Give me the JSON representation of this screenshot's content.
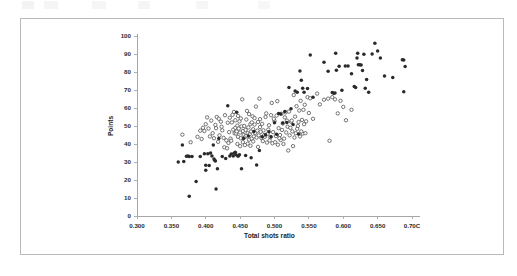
{
  "figure": {
    "background_color": "#ffffff",
    "border_color": "#b9b9b9",
    "frame": {
      "x": 20,
      "y": 18,
      "width": 484,
      "height": 237
    }
  },
  "chart_data": {
    "type": "scatter",
    "title": "",
    "xlabel": "Total shots ratio",
    "ylabel": "Points",
    "xlim": [
      0.3,
      0.7
    ],
    "ylim": [
      0,
      100
    ],
    "grid": false,
    "legend": null,
    "xticks": [
      0.3,
      0.35,
      0.4,
      0.45,
      0.5,
      0.55,
      0.6,
      0.65,
      0.7
    ],
    "xtick_labels": [
      "0.300",
      "0.350",
      "0.400",
      "0.450",
      "0.500",
      "0.550",
      "0.600",
      "0.650",
      "0.70C"
    ],
    "yticks": [
      0,
      10,
      20,
      30,
      40,
      50,
      60,
      70,
      80,
      90,
      100
    ],
    "ytick_labels": [
      "0",
      "10",
      "20",
      "30",
      "40",
      "50",
      "60",
      "70",
      "80",
      "90",
      "100"
    ],
    "plot_area_px": {
      "x0": 137,
      "y0": 216,
      "x1": 412,
      "y1": 36
    },
    "marker_colors": {
      "filled": "#2a2a2a",
      "open_edge": "#4a4a4a",
      "open_face": "#ffffff"
    },
    "series": [
      {
        "name": "filled",
        "marker": "filled-circle",
        "points": [
          [
            0.36,
            30.0
          ],
          [
            0.366,
            39.4
          ],
          [
            0.368,
            30.3
          ],
          [
            0.372,
            33.2
          ],
          [
            0.374,
            33.3
          ],
          [
            0.376,
            33.0
          ],
          [
            0.376,
            11.0
          ],
          [
            0.38,
            33.0
          ],
          [
            0.386,
            19.2
          ],
          [
            0.392,
            33.0
          ],
          [
            0.398,
            34.6
          ],
          [
            0.4,
            28.2
          ],
          [
            0.4,
            25.4
          ],
          [
            0.403,
            34.6
          ],
          [
            0.405,
            28.1
          ],
          [
            0.407,
            35.0
          ],
          [
            0.409,
            33.4
          ],
          [
            0.411,
            39.4
          ],
          [
            0.412,
            31.6
          ],
          [
            0.413,
            31.0
          ],
          [
            0.414,
            30.6
          ],
          [
            0.415,
            15.0
          ],
          [
            0.417,
            26.2
          ],
          [
            0.419,
            43.0
          ],
          [
            0.424,
            33.0
          ],
          [
            0.429,
            32.0
          ],
          [
            0.432,
            61.2
          ],
          [
            0.435,
            33.4
          ],
          [
            0.437,
            34.5
          ],
          [
            0.44,
            33.3
          ],
          [
            0.441,
            34.8
          ],
          [
            0.443,
            35.4
          ],
          [
            0.444,
            34.0
          ],
          [
            0.445,
            57.6
          ],
          [
            0.447,
            33.2
          ],
          [
            0.449,
            34.0
          ],
          [
            0.452,
            26.3
          ],
          [
            0.455,
            43.0
          ],
          [
            0.458,
            33.6
          ],
          [
            0.462,
            44.5
          ],
          [
            0.466,
            32.4
          ],
          [
            0.47,
            47.0
          ],
          [
            0.474,
            28.3
          ],
          [
            0.478,
            36.4
          ],
          [
            0.482,
            44.0
          ],
          [
            0.487,
            45.2
          ],
          [
            0.492,
            46.8
          ],
          [
            0.495,
            44.0
          ],
          [
            0.5,
            51.8
          ],
          [
            0.503,
            45.4
          ],
          [
            0.506,
            57.0
          ],
          [
            0.509,
            56.6
          ],
          [
            0.512,
            51.6
          ],
          [
            0.515,
            58.0
          ],
          [
            0.518,
            52.0
          ],
          [
            0.521,
            71.4
          ],
          [
            0.524,
            59.6
          ],
          [
            0.527,
            50.8
          ],
          [
            0.53,
            69.4
          ],
          [
            0.533,
            68.8
          ],
          [
            0.535,
            45.6
          ],
          [
            0.537,
            80.6
          ],
          [
            0.539,
            75.4
          ],
          [
            0.541,
            71.0
          ],
          [
            0.543,
            68.8
          ],
          [
            0.548,
            70.8
          ],
          [
            0.552,
            89.4
          ],
          [
            0.556,
            66.0
          ],
          [
            0.572,
            85.4
          ],
          [
            0.578,
            80.4
          ],
          [
            0.584,
            68.6
          ],
          [
            0.586,
            68.2
          ],
          [
            0.588,
            68.4
          ],
          [
            0.589,
            90.4
          ],
          [
            0.59,
            81.0
          ],
          [
            0.594,
            83.2
          ],
          [
            0.598,
            69.8
          ],
          [
            0.603,
            83.4
          ],
          [
            0.607,
            83.3
          ],
          [
            0.612,
            79.0
          ],
          [
            0.616,
            72.0
          ],
          [
            0.618,
            71.4
          ],
          [
            0.62,
            87.8
          ],
          [
            0.621,
            90.4
          ],
          [
            0.622,
            84.0
          ],
          [
            0.624,
            84.0
          ],
          [
            0.626,
            83.9
          ],
          [
            0.628,
            80.8
          ],
          [
            0.63,
            89.8
          ],
          [
            0.632,
            71.0
          ],
          [
            0.634,
            75.8
          ],
          [
            0.637,
            68.8
          ],
          [
            0.642,
            90.0
          ],
          [
            0.646,
            96.0
          ],
          [
            0.65,
            91.6
          ],
          [
            0.654,
            87.8
          ],
          [
            0.66,
            77.8
          ],
          [
            0.672,
            77.0
          ],
          [
            0.686,
            86.8
          ],
          [
            0.688,
            86.6
          ],
          [
            0.69,
            83.0
          ],
          [
            0.688,
            69.0
          ]
        ]
      },
      {
        "name": "open",
        "marker": "open-circle",
        "points": [
          [
            0.366,
            45.2
          ],
          [
            0.378,
            41.0
          ],
          [
            0.388,
            44.0
          ],
          [
            0.392,
            47.4
          ],
          [
            0.396,
            49.0
          ],
          [
            0.398,
            47.2
          ],
          [
            0.4,
            51.0
          ],
          [
            0.402,
            54.8
          ],
          [
            0.404,
            48.6
          ],
          [
            0.406,
            44.2
          ],
          [
            0.408,
            53.0
          ],
          [
            0.412,
            43.2
          ],
          [
            0.416,
            55.0
          ],
          [
            0.42,
            44.8
          ],
          [
            0.424,
            47.6
          ],
          [
            0.426,
            43.4
          ],
          [
            0.428,
            56.0
          ],
          [
            0.43,
            42.0
          ],
          [
            0.432,
            51.8
          ],
          [
            0.434,
            46.6
          ],
          [
            0.436,
            43.0
          ],
          [
            0.438,
            52.0
          ],
          [
            0.44,
            48.0
          ],
          [
            0.441,
            57.8
          ],
          [
            0.442,
            46.0
          ],
          [
            0.443,
            49.0
          ],
          [
            0.444,
            45.8
          ],
          [
            0.445,
            47.0
          ],
          [
            0.446,
            50.2
          ],
          [
            0.447,
            44.0
          ],
          [
            0.448,
            48.6
          ],
          [
            0.449,
            52.6
          ],
          [
            0.45,
            46.4
          ],
          [
            0.451,
            43.2
          ],
          [
            0.452,
            49.8
          ],
          [
            0.453,
            64.8
          ],
          [
            0.454,
            47.2
          ],
          [
            0.455,
            45.0
          ],
          [
            0.456,
            50.0
          ],
          [
            0.457,
            43.8
          ],
          [
            0.458,
            47.8
          ],
          [
            0.459,
            44.6
          ],
          [
            0.46,
            58.4
          ],
          [
            0.461,
            46.0
          ],
          [
            0.462,
            49.2
          ],
          [
            0.463,
            42.4
          ],
          [
            0.464,
            45.4
          ],
          [
            0.465,
            51.0
          ],
          [
            0.466,
            47.0
          ],
          [
            0.467,
            43.0
          ],
          [
            0.468,
            55.4
          ],
          [
            0.469,
            48.2
          ],
          [
            0.47,
            44.2
          ],
          [
            0.471,
            50.8
          ],
          [
            0.472,
            46.2
          ],
          [
            0.473,
            60.8
          ],
          [
            0.474,
            43.6
          ],
          [
            0.475,
            47.4
          ],
          [
            0.476,
            52.2
          ],
          [
            0.477,
            44.8
          ],
          [
            0.478,
            65.2
          ],
          [
            0.479,
            49.4
          ],
          [
            0.48,
            46.8
          ],
          [
            0.481,
            43.4
          ],
          [
            0.482,
            51.2
          ],
          [
            0.484,
            47.6
          ],
          [
            0.486,
            44.0
          ],
          [
            0.488,
            57.0
          ],
          [
            0.49,
            45.6
          ],
          [
            0.492,
            50.4
          ],
          [
            0.494,
            43.8
          ],
          [
            0.496,
            62.8
          ],
          [
            0.498,
            46.6
          ],
          [
            0.5,
            52.8
          ],
          [
            0.502,
            44.4
          ],
          [
            0.504,
            63.8
          ],
          [
            0.506,
            48.8
          ],
          [
            0.508,
            45.0
          ],
          [
            0.51,
            56.8
          ],
          [
            0.512,
            51.4
          ],
          [
            0.514,
            43.0
          ],
          [
            0.516,
            57.6
          ],
          [
            0.517,
            46.4
          ],
          [
            0.518,
            53.0
          ],
          [
            0.519,
            49.6
          ],
          [
            0.52,
            36.4
          ],
          [
            0.521,
            58.0
          ],
          [
            0.522,
            44.8
          ],
          [
            0.524,
            52.4
          ],
          [
            0.526,
            47.0
          ],
          [
            0.527,
            38.8
          ],
          [
            0.528,
            67.2
          ],
          [
            0.53,
            55.2
          ],
          [
            0.531,
            46.0
          ],
          [
            0.532,
            61.0
          ],
          [
            0.534,
            50.0
          ],
          [
            0.536,
            58.6
          ],
          [
            0.537,
            44.2
          ],
          [
            0.538,
            64.0
          ],
          [
            0.54,
            53.4
          ],
          [
            0.541,
            45.8
          ],
          [
            0.542,
            59.0
          ],
          [
            0.544,
            61.8
          ],
          [
            0.546,
            52.6
          ],
          [
            0.548,
            66.0
          ],
          [
            0.55,
            57.2
          ],
          [
            0.552,
            65.4
          ],
          [
            0.556,
            54.0
          ],
          [
            0.562,
            68.0
          ],
          [
            0.566,
            62.0
          ],
          [
            0.572,
            64.6
          ],
          [
            0.578,
            65.2
          ],
          [
            0.58,
            41.8
          ],
          [
            0.584,
            66.0
          ],
          [
            0.588,
            64.8
          ],
          [
            0.592,
            57.0
          ],
          [
            0.596,
            64.0
          ],
          [
            0.6,
            60.6
          ],
          [
            0.604,
            53.2
          ],
          [
            0.612,
            59.0
          ],
          [
            0.418,
            41.2
          ],
          [
            0.422,
            52.4
          ],
          [
            0.41,
            46.0
          ],
          [
            0.414,
            50.6
          ],
          [
            0.394,
            42.8
          ],
          [
            0.483,
            41.6
          ],
          [
            0.489,
            40.8
          ],
          [
            0.493,
            42.0
          ],
          [
            0.497,
            40.4
          ],
          [
            0.501,
            41.0
          ],
          [
            0.505,
            39.6
          ],
          [
            0.509,
            42.2
          ],
          [
            0.513,
            40.0
          ],
          [
            0.433,
            40.6
          ],
          [
            0.437,
            41.8
          ],
          [
            0.427,
            38.2
          ],
          [
            0.431,
            37.6
          ],
          [
            0.461,
            40.2
          ],
          [
            0.465,
            39.0
          ],
          [
            0.469,
            41.4
          ],
          [
            0.446,
            40.0
          ],
          [
            0.45,
            38.8
          ],
          [
            0.454,
            41.0
          ],
          [
            0.457,
            39.4
          ],
          [
            0.476,
            38.4
          ],
          [
            0.485,
            45.0
          ],
          [
            0.491,
            48.0
          ],
          [
            0.499,
            54.0
          ],
          [
            0.507,
            43.2
          ],
          [
            0.511,
            47.8
          ],
          [
            0.523,
            49.0
          ],
          [
            0.529,
            43.6
          ],
          [
            0.533,
            48.4
          ],
          [
            0.539,
            47.0
          ],
          [
            0.545,
            46.0
          ],
          [
            0.415,
            48.8
          ],
          [
            0.419,
            54.0
          ],
          [
            0.423,
            49.6
          ],
          [
            0.435,
            54.6
          ],
          [
            0.439,
            56.2
          ],
          [
            0.443,
            53.2
          ],
          [
            0.447,
            55.6
          ],
          [
            0.451,
            54.2
          ],
          [
            0.459,
            53.6
          ],
          [
            0.463,
            56.6
          ],
          [
            0.467,
            52.0
          ],
          [
            0.471,
            54.4
          ],
          [
            0.479,
            53.8
          ],
          [
            0.487,
            55.0
          ],
          [
            0.495,
            56.0
          ],
          [
            0.503,
            55.8
          ],
          [
            0.515,
            54.8
          ],
          [
            0.525,
            53.0
          ],
          [
            0.535,
            52.2
          ],
          [
            0.543,
            51.0
          ]
        ]
      }
    ]
  }
}
